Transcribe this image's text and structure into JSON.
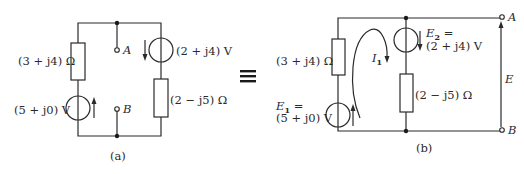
{
  "figure_a": {
    "caption": "(a)",
    "left_impedance": "(3 + j4) Ω",
    "left_source": "(5 + j0) V",
    "right_source": "(2 + j4) V",
    "right_impedance": "(2 − j5) Ω",
    "terminal_a": "A",
    "terminal_b": "B"
  },
  "equivalence_symbol": "≡",
  "figure_b": {
    "caption": "(b)",
    "left_impedance": "(3 + j4) Ω",
    "e1_label": "E",
    "e1_sub": "1",
    "e1_eq": " =",
    "e1_value": "(5 + j0) V",
    "e2_label": "E",
    "e2_sub": "2",
    "e2_eq": " =",
    "e2_value": "(2 + j4) V",
    "right_impedance": "(2 − j5) Ω",
    "loop_current": "I",
    "loop_current_sub": "1",
    "output_voltage": "E",
    "terminal_a": "A",
    "terminal_b": "B"
  }
}
